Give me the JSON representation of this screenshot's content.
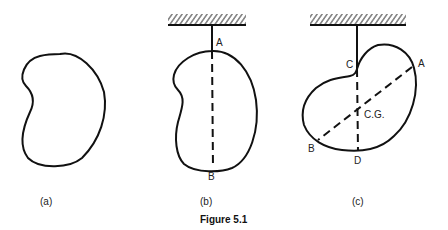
{
  "figure": {
    "caption": "Figure 5.1",
    "panels": [
      {
        "id": "a",
        "caption": "(a)",
        "labels": []
      },
      {
        "id": "b",
        "caption": "(b)",
        "labels": [
          "A",
          "B"
        ]
      },
      {
        "id": "c",
        "caption": "(c)",
        "labels": [
          "C",
          "A",
          "C.G.",
          "B",
          "D"
        ]
      }
    ]
  },
  "colors": {
    "stroke": "#111111",
    "background": "#ffffff"
  }
}
